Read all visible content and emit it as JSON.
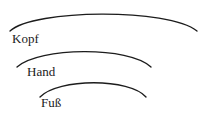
{
  "diagram": {
    "type": "nested-arc-scope-diagram",
    "background_color": "#ffffff",
    "stroke_color": "#1c1c1c",
    "text_color": "#1a1a1a",
    "width": 205,
    "height": 118,
    "arcs": [
      {
        "id": "arc-kopf",
        "label": "Kopf",
        "level": 1,
        "path": "M 10 31 C 34 9, 168 8, 197 31"
      },
      {
        "id": "arc-hand",
        "label": "Hand",
        "level": 2,
        "path": "M 17 67 C 39 47, 129 46, 151 67"
      },
      {
        "id": "arc-fuss",
        "label": "Fuß",
        "level": 3,
        "path": "M 40 97 C 58 78, 130 78, 146 97"
      }
    ],
    "labels": {
      "kopf": "Kopf",
      "hand": "Hand",
      "fuss": "Fuß"
    }
  }
}
